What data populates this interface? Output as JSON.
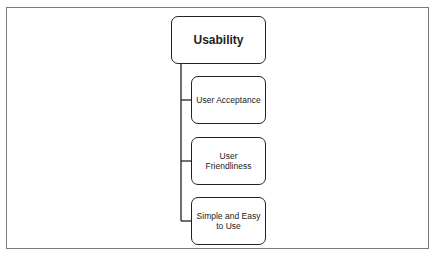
{
  "diagram": {
    "type": "hierarchy",
    "root": {
      "label": "Usability"
    },
    "children": [
      {
        "label": "User Acceptance"
      },
      {
        "label": "User Friendliness"
      },
      {
        "label": "Simple and Easy to Use"
      }
    ],
    "colors": {
      "stroke": "#222222",
      "frame": "#7a7a7a",
      "background": "#ffffff"
    }
  }
}
